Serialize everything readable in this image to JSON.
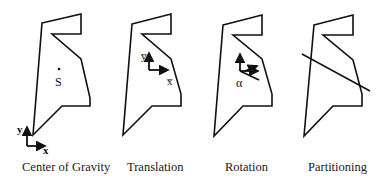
{
  "panels": [
    {
      "caption": "Center of Gravity",
      "point_label": "S",
      "axis_x": "x",
      "axis_y": "y"
    },
    {
      "caption": "Translation",
      "axis_x": "x̅",
      "axis_y": "y̅"
    },
    {
      "caption": "Rotation",
      "angle_label": "α"
    },
    {
      "caption": "Partitioning"
    }
  ],
  "colors": {
    "stroke": "#111111",
    "background": "#ffffff"
  }
}
